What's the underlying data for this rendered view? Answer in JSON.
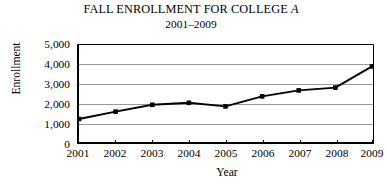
{
  "chart_data": {
    "type": "line",
    "title": "FALL ENROLLMENT FOR COLLEGE A",
    "title_plain": "FALL ENROLLMENT FOR COLLEGE ",
    "title_italic_suffix": "A",
    "subtitle": "2001–2009",
    "xlabel": "Year",
    "ylabel": "Enrollment",
    "categories": [
      "2001",
      "2002",
      "2003",
      "2004",
      "2005",
      "2006",
      "2007",
      "2008",
      "2009"
    ],
    "x": [
      2001,
      2002,
      2003,
      2004,
      2005,
      2006,
      2007,
      2008,
      2009
    ],
    "values": [
      1250,
      1620,
      1960,
      2060,
      1880,
      2380,
      2680,
      2820,
      3880
    ],
    "ylim": [
      0,
      5000
    ],
    "ytick_values": [
      0,
      1000,
      2000,
      3000,
      4000,
      5000
    ],
    "ytick_labels": [
      "0",
      "1,000",
      "2,000",
      "3,000",
      "4,000",
      "5,000"
    ],
    "grid": true,
    "grid_axis": "y",
    "legend": false,
    "marker": "square",
    "line_color": "#000000",
    "grid_color": "#9a9a9a",
    "axis_color": "#000000",
    "background": "#ffffff"
  }
}
